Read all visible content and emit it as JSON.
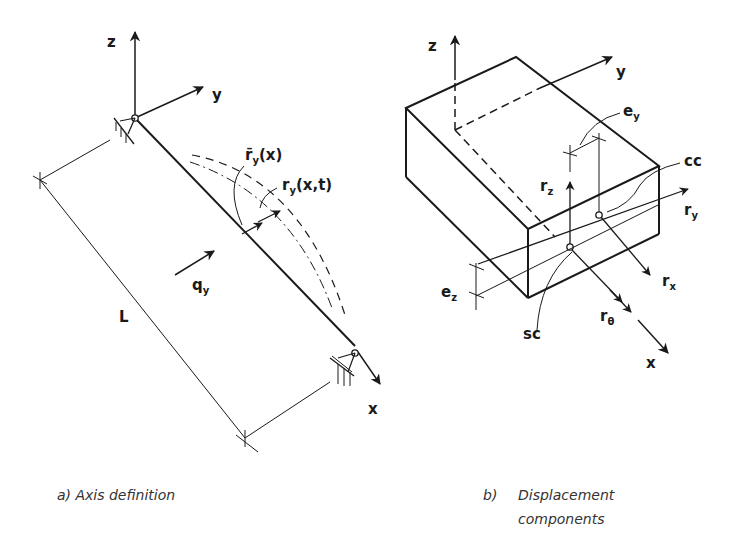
{
  "panel_a": {
    "caption": "a) Axis definition",
    "labels": {
      "z": "z",
      "y": "y",
      "x": "x",
      "L": "L",
      "q_base": "q",
      "q_sub": "y",
      "rbar_base": "r̄",
      "rbar_sub": "y",
      "rbar_arg": "(x)",
      "r_base": "r",
      "r_sub": "y",
      "r_arg": "(x,t)"
    }
  },
  "panel_b": {
    "caption_prefix": "b)",
    "caption_line1": "Displacement",
    "caption_line2": "components",
    "labels": {
      "z": "z",
      "y": "y",
      "x": "x",
      "ey_base": "e",
      "ey_sub": "y",
      "ez_base": "e",
      "ez_sub": "z",
      "cc": "cc",
      "sc": "sc",
      "rz_base": "r",
      "rz_sub": "z",
      "ry_base": "r",
      "ry_sub": "y",
      "rx_base": "r",
      "rx_sub": "x",
      "rtheta_base": "r",
      "rtheta_sub": "θ"
    }
  }
}
